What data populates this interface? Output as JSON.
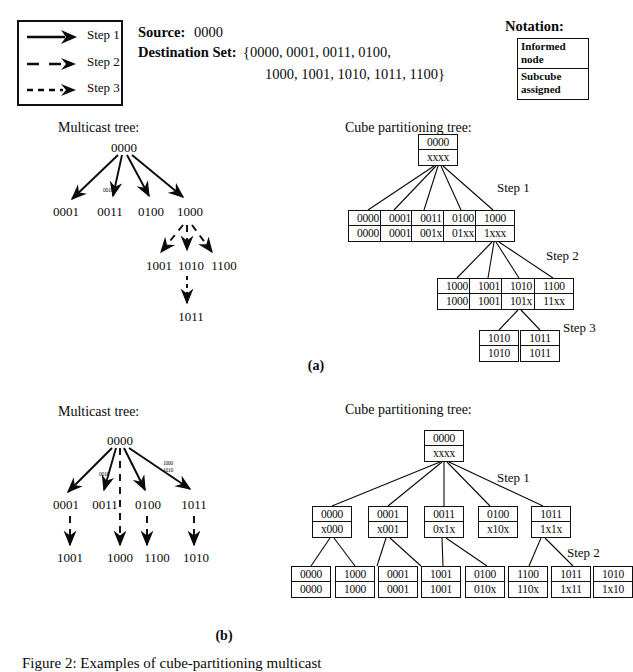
{
  "legend": {
    "title": "legend",
    "items": [
      {
        "label": "Step 1",
        "style": "solid"
      },
      {
        "label": "Step 2",
        "style": "dashed"
      },
      {
        "label": "Step 3",
        "style": "dotted"
      }
    ]
  },
  "header": {
    "source_label": "Source:",
    "source_value": "0000",
    "destination_label": "Destination Set:",
    "destination_line1": "{0000, 0001, 0011, 0100,",
    "destination_line2": "1000, 1001, 1010, 1011, 1100}",
    "notation_title": "Notation:",
    "notation_top_line1": "Informed",
    "notation_top_line2": "node",
    "notation_bottom_line1": "Subcube",
    "notation_bottom_line2": "assigned"
  },
  "panel_a": {
    "label": "(a)",
    "multicast_title": "Multicast tree:",
    "cube_title": "Cube partitioning tree:",
    "mc_nodes": {
      "root": "0000",
      "l1": [
        "0001",
        "0011",
        "0100",
        "1000"
      ],
      "l2": [
        "1001",
        "1010",
        "1100"
      ],
      "l3": [
        "1011"
      ]
    },
    "mc_edge_tags": [
      "0010"
    ],
    "steps": [
      "Step 1",
      "Step 2",
      "Step 3"
    ],
    "cube_nodes": {
      "root": {
        "top": "0000",
        "bottom": "xxxx"
      },
      "l1": [
        {
          "top": "0000",
          "bottom": "0000"
        },
        {
          "top": "0001",
          "bottom": "0001"
        },
        {
          "top": "0011",
          "bottom": "001x"
        },
        {
          "top": "0100",
          "bottom": "01xx"
        },
        {
          "top": "1000",
          "bottom": "1xxx"
        }
      ],
      "l2": [
        {
          "top": "1000",
          "bottom": "1000"
        },
        {
          "top": "1001",
          "bottom": "1001"
        },
        {
          "top": "1010",
          "bottom": "101x"
        },
        {
          "top": "1100",
          "bottom": "11xx"
        }
      ],
      "l3": [
        {
          "top": "1010",
          "bottom": "1010"
        },
        {
          "top": "1011",
          "bottom": "1011"
        }
      ]
    }
  },
  "panel_b": {
    "label": "(b)",
    "multicast_title": "Multicast tree:",
    "cube_title": "Cube partitioning tree:",
    "mc_nodes": {
      "root": "0000",
      "l1": [
        "0001",
        "0011",
        "0100",
        "1011"
      ],
      "l2": [
        "1001",
        "1000",
        "1100",
        "1010"
      ]
    },
    "mc_edge_tags": [
      "0010",
      "1000",
      "1010"
    ],
    "steps": [
      "Step 1",
      "Step 2"
    ],
    "cube_nodes": {
      "root": {
        "top": "0000",
        "bottom": "xxxx"
      },
      "l1": [
        {
          "top": "0000",
          "bottom": "x000"
        },
        {
          "top": "0001",
          "bottom": "x001"
        },
        {
          "top": "0011",
          "bottom": "0x1x"
        },
        {
          "top": "0100",
          "bottom": "x10x"
        },
        {
          "top": "1011",
          "bottom": "1x1x"
        }
      ],
      "l2": [
        {
          "top": "0000",
          "bottom": "0000"
        },
        {
          "top": "1000",
          "bottom": "1000"
        },
        {
          "top": "0001",
          "bottom": "0001"
        },
        {
          "top": "1001",
          "bottom": "1001"
        },
        {
          "top": "0100",
          "bottom": "010x"
        },
        {
          "top": "1100",
          "bottom": "110x"
        },
        {
          "top": "1011",
          "bottom": "1x11"
        },
        {
          "top": "1010",
          "bottom": "1x10"
        }
      ]
    }
  },
  "caption": {
    "text": "Figure 2:  Examples of cube-partitioning multicast"
  },
  "colors": {
    "ink": "#0a0a0a",
    "paper": "#ffffff"
  }
}
